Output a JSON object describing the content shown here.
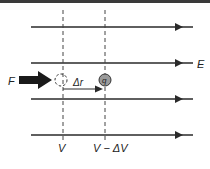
{
  "diagram": {
    "field_label": "E",
    "force_label": "F",
    "displacement_label": "Δr",
    "charge_label": "q",
    "potential_left_label": "V",
    "potential_right_label": "V − ΔV",
    "field_lines_count": 4,
    "colors": {
      "line": "#2a2a2a",
      "charge_fill": "#9a9a9a",
      "background": "#ffffff"
    }
  }
}
